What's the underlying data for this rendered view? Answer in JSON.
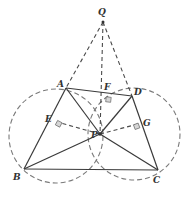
{
  "diagram": {
    "type": "geometry",
    "points": {
      "Q": {
        "label": "Q",
        "x": 103,
        "y": 22,
        "lx": 98,
        "ly": 15
      },
      "A": {
        "label": "A",
        "x": 66,
        "y": 88,
        "lx": 57,
        "ly": 87
      },
      "D": {
        "label": "D",
        "x": 132,
        "y": 96,
        "lx": 134,
        "ly": 95
      },
      "F": {
        "label": "F",
        "x": 107,
        "y": 95,
        "lx": 104,
        "ly": 90
      },
      "B": {
        "label": "B",
        "x": 24,
        "y": 169,
        "lx": 13,
        "ly": 177
      },
      "C": {
        "label": "C",
        "x": 158,
        "y": 170,
        "lx": 153,
        "ly": 181
      },
      "P": {
        "label": "P",
        "x": 100,
        "y": 134,
        "lx": 91,
        "ly": 137
      },
      "E": {
        "label": "E",
        "x": 57,
        "y": 122,
        "lx": 45,
        "ly": 122
      },
      "G": {
        "label": "G",
        "x": 138,
        "y": 124,
        "lx": 143,
        "ly": 126
      }
    },
    "solid_segments": [
      "AD",
      "AB",
      "BC",
      "DC",
      "AP",
      "BP",
      "CP",
      "DP"
    ],
    "dashed_segments": [
      "QA",
      "QD",
      "QP",
      "PE",
      "PF",
      "PG",
      "AC?"
    ],
    "circles": [
      {
        "name": "circle-ABP",
        "cx": 56,
        "cy": 136,
        "r": 47
      },
      {
        "name": "circle-DCP",
        "cx": 134,
        "cy": 134,
        "r": 46
      }
    ],
    "right_angle_marks": [
      "E",
      "F",
      "G"
    ]
  }
}
